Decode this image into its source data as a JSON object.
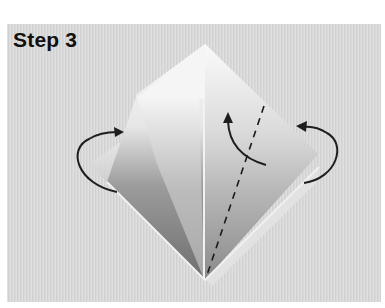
{
  "figure": {
    "title": "Step 3",
    "annotations": {
      "left_arrow": "curved-arrow-fold-behind-left",
      "right_arrow": "curved-arrow-fold-behind-right",
      "center_arrow": "curved-arrow-fold-up",
      "fold_line": "dashed-valley-fold-line"
    },
    "colors": {
      "background": "#d9d9d9",
      "paper_light": "#f7f7f7",
      "paper_shadow": "#8a8a8a",
      "arrow": "#1e1e1e",
      "title": "#111111"
    }
  }
}
